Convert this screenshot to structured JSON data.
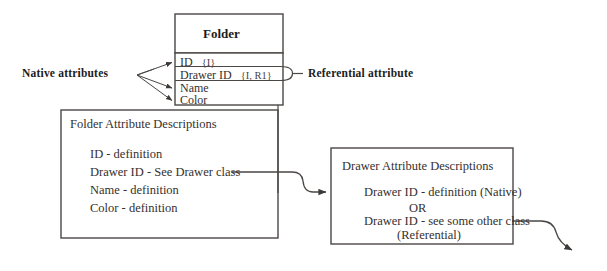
{
  "diagram": {
    "title_hidden": "",
    "colors": {
      "background": "#ffffff",
      "line": "#4a4745",
      "text": "#35302e",
      "bold_text": "#1d1b1b"
    }
  },
  "annotations": {
    "native_attributes_label": "Native attributes",
    "referential_attribute_label": "Referential attribute"
  },
  "folder_class": {
    "name": "Folder",
    "attributes": [
      {
        "name": "ID",
        "tag": "{I}",
        "kind": "native"
      },
      {
        "name": "Drawer ID",
        "tag": "{I, R1}",
        "kind": "referential"
      },
      {
        "name": "Name",
        "tag": "",
        "kind": "native"
      },
      {
        "name": "Color",
        "tag": "",
        "kind": "native"
      }
    ]
  },
  "folder_descriptions": {
    "title": "Folder Attribute Descriptions",
    "lines": [
      "ID - definition",
      "Drawer ID - See Drawer class",
      "Name - definition",
      "Color - definition"
    ]
  },
  "drawer_descriptions": {
    "title": "Drawer Attribute Descriptions",
    "lines": [
      "Drawer ID - definition (Native)",
      "OR",
      "Drawer ID - see some other class",
      "(Referential)"
    ]
  }
}
